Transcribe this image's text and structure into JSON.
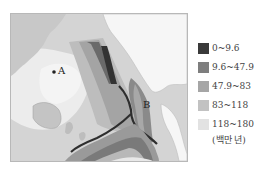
{
  "map": {
    "title": "",
    "markers": [
      {
        "id": "A",
        "label": "A"
      },
      {
        "id": "B",
        "label": "B"
      }
    ]
  },
  "legend": {
    "items": [
      {
        "label": "0~9.6",
        "color": "#3a3a3a"
      },
      {
        "label": "9.6~47.9",
        "color": "#7e7e7e"
      },
      {
        "label": "47.9~83",
        "color": "#a6a6a6"
      },
      {
        "label": "83~118",
        "color": "#c2c2c2"
      },
      {
        "label": "118~180",
        "color": "#e2e2e2"
      }
    ],
    "unit": "(백만 년)"
  }
}
